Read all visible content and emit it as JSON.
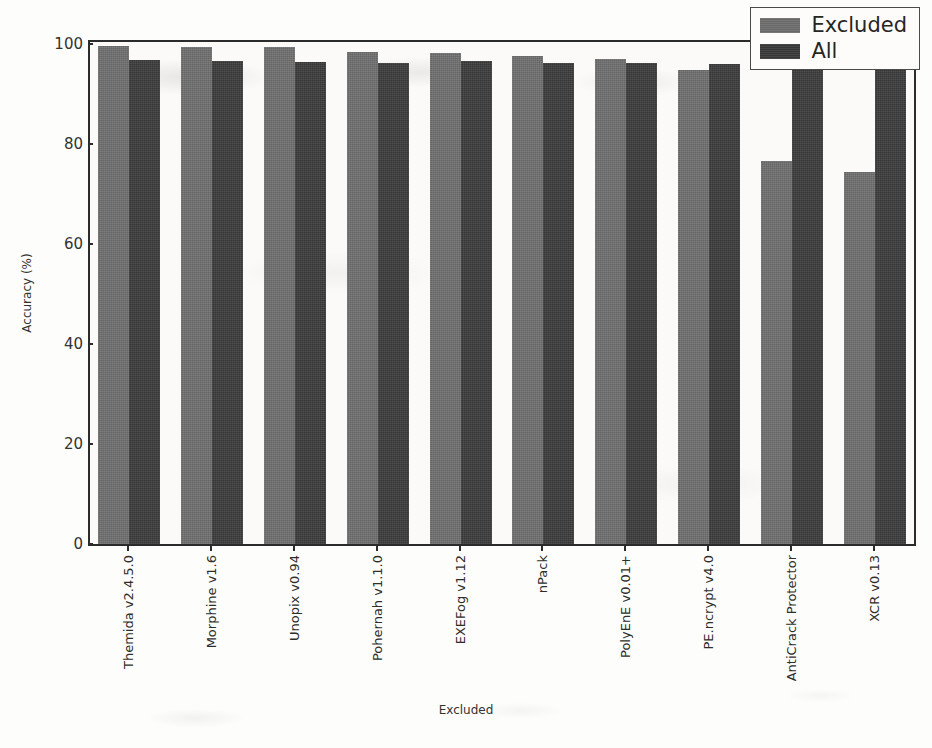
{
  "chart_data": {
    "type": "bar",
    "title": "",
    "xlabel": "Excluded",
    "ylabel": "Accuracy (%)",
    "ylim": [
      0,
      100
    ],
    "yticks": [
      0,
      20,
      40,
      60,
      80,
      100
    ],
    "grid": false,
    "legend_position": "upper right",
    "categories": [
      "Themida v2.4.5.0",
      "Morphine v1.6",
      "Unopix v0.94",
      "Pohernah v1.1.0",
      "EXEFog v1.12",
      "nPack",
      "PolyEnE v0.01+",
      "PE.ncrypt v4.0",
      "AntiCrack Protector",
      "XCR v0.13"
    ],
    "series": [
      {
        "name": "Excluded",
        "color": "#6e6e6e",
        "values": [
          99.6,
          99.5,
          99.5,
          98.5,
          98.2,
          97.7,
          97.0,
          94.9,
          76.6,
          74.4
        ]
      },
      {
        "name": "All",
        "color": "#3a3a3a",
        "values": [
          96.9,
          96.7,
          96.5,
          96.3,
          96.6,
          96.2,
          96.2,
          96.1,
          96.2,
          96.2
        ]
      }
    ]
  },
  "legend": {
    "entries": [
      {
        "label": "Excluded",
        "swatch_class": "excluded"
      },
      {
        "label": "All",
        "swatch_class": "all"
      }
    ]
  },
  "colors": {
    "series_excluded": "#6e6e6e",
    "series_all": "#3a3a3a",
    "axis": "#2b2b2b",
    "plot_background": "#fbfaf8",
    "page_background": "#fdfdfc"
  }
}
